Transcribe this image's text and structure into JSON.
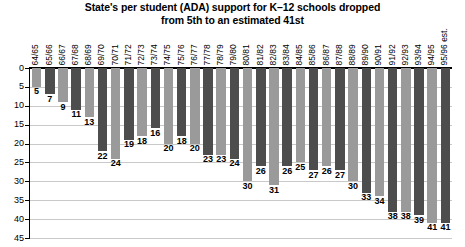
{
  "chart_data": {
    "type": "bar",
    "title": "State's per student (ADA) support for K–12 schools dropped from 5th to an estimated 41st",
    "title_lines": [
      "State's per student (ADA) support for K–12 schools dropped",
      "from 5th to an estimated 41st"
    ],
    "xlabel": "",
    "ylabel": "",
    "ylim": [
      0,
      45
    ],
    "y_inverted": true,
    "grid": true,
    "legend": "none",
    "y_ticks": [
      0,
      5,
      10,
      15,
      20,
      25,
      30,
      35,
      40,
      45
    ],
    "categories": [
      "64/65",
      "65/66",
      "66/67",
      "67/68",
      "68/69",
      "69/70",
      "70/71",
      "71/72",
      "72/73",
      "73/74",
      "74/75",
      "75/76",
      "76/77",
      "77/78",
      "78/79",
      "79/80",
      "80/81",
      "81/82",
      "82/83",
      "83/84",
      "84/85",
      "85/86",
      "86/87",
      "87/88",
      "88/89",
      "89/90",
      "90/91",
      "91/92",
      "92/93",
      "93/94",
      "94/95",
      "95/96 est."
    ],
    "values": [
      5,
      7,
      9,
      11,
      13,
      22,
      24,
      19,
      18,
      16,
      20,
      18,
      20,
      23,
      23,
      24,
      30,
      26,
      31,
      26,
      25,
      27,
      26,
      27,
      30,
      33,
      34,
      38,
      38,
      39,
      41,
      41
    ],
    "bar_colors": [
      "#9a9a9a",
      "#4d4d4d"
    ],
    "bar_color_pattern": "alternating",
    "series": [
      {
        "name": "State rank",
        "values": [
          5,
          7,
          9,
          11,
          13,
          22,
          24,
          19,
          18,
          16,
          20,
          18,
          20,
          23,
          23,
          24,
          30,
          26,
          31,
          26,
          25,
          27,
          26,
          27,
          30,
          33,
          34,
          38,
          38,
          39,
          41,
          41
        ]
      }
    ]
  }
}
